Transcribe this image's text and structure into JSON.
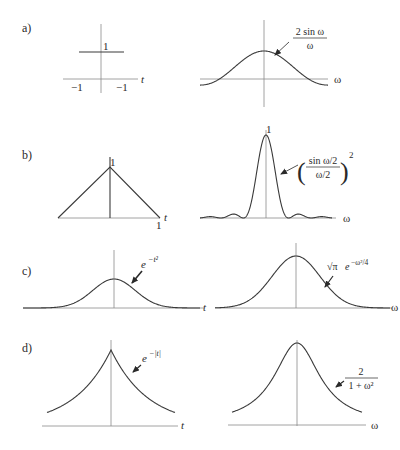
{
  "figure": {
    "panels": [
      {
        "id": "a",
        "label": "a)",
        "left": {
          "function": "rectangular pulse",
          "height_label": "1",
          "tick_left": "−1",
          "tick_right": "−1",
          "axis_label": "t"
        },
        "right": {
          "function": "2 sin ω / ω",
          "numerator": "2 sin ω",
          "denominator": "ω",
          "axis_label": "ω"
        }
      },
      {
        "id": "b",
        "label": "b)",
        "left": {
          "function": "triangular pulse",
          "peak_label": "1",
          "tick_right": "1",
          "axis_label": "t"
        },
        "right": {
          "function": "(sin(ω/2)/(ω/2))^2",
          "peak_label": "1",
          "numerator": "sin ω/2",
          "denominator": "ω/2",
          "exponent": "2",
          "axis_label": "ω"
        }
      },
      {
        "id": "c",
        "label": "c)",
        "left": {
          "function": "e^{-t^2}",
          "base": "e",
          "exponent": "−t²",
          "axis_label": "t"
        },
        "right": {
          "function": "√π e^{-ω^2/4}",
          "prefix": "√π",
          "base": "e",
          "exponent": "−ω²/4",
          "axis_label": "ω"
        }
      },
      {
        "id": "d",
        "label": "d)",
        "left": {
          "function": "e^{-|t|}",
          "base": "e",
          "exponent": "−|t|",
          "axis_label": "t"
        },
        "right": {
          "function": "2/(1+ω^2)",
          "numerator": "2",
          "denominator": "1 + ω²",
          "axis_label": "ω"
        }
      }
    ]
  },
  "colors": {
    "axis": "#8a8a8a",
    "curve": "#3a3a3a",
    "text": "#2a2a2a"
  }
}
